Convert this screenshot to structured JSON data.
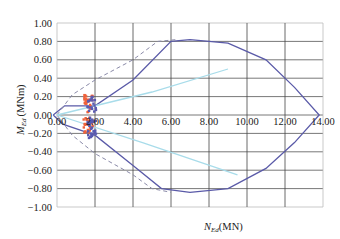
{
  "chart_data": {
    "type": "line",
    "title": "",
    "xlabel": "N_Ed (MN)",
    "ylabel": "M_Ed (MNm)",
    "xlabel_main": "N",
    "xlabel_sub": "Ed",
    "xlabel_unit": "(MN)",
    "ylabel_main": "M",
    "ylabel_sub": "Ed",
    "ylabel_unit": "(MNm)",
    "xlim": [
      0,
      14
    ],
    "ylim": [
      -1.0,
      1.0
    ],
    "grid": true,
    "x_ticks": [
      "0.00",
      "2.00",
      "4.00",
      "6.00",
      "8.00",
      "10.00",
      "12.00",
      "14.00"
    ],
    "y_ticks": [
      "1.00",
      "0.80",
      "0.60",
      "0.40",
      "0.20",
      "0.00",
      "-0.20",
      "-0.40",
      "-0.60",
      "-0.80",
      "-1.00"
    ],
    "series": [
      {
        "name": "interaction-envelope",
        "style": "solid",
        "color": "#5a5aa8",
        "points": [
          [
            -0.2,
            0.0
          ],
          [
            0.4,
            0.1
          ],
          [
            2.0,
            0.1
          ],
          [
            4.0,
            0.38
          ],
          [
            6.0,
            0.8
          ],
          [
            7.0,
            0.82
          ],
          [
            9.0,
            0.78
          ],
          [
            11.0,
            0.6
          ],
          [
            12.5,
            0.3
          ],
          [
            13.8,
            0.0
          ],
          [
            12.5,
            -0.3
          ],
          [
            11.0,
            -0.58
          ],
          [
            9.0,
            -0.8
          ],
          [
            7.0,
            -0.84
          ],
          [
            5.5,
            -0.8
          ],
          [
            4.0,
            -0.55
          ],
          [
            2.0,
            -0.22
          ],
          [
            0.3,
            -0.1
          ],
          [
            -0.2,
            0.0
          ]
        ]
      },
      {
        "name": "envelope-dashed",
        "style": "dashed",
        "color": "#8a8aa8",
        "points": [
          [
            0.0,
            0.0
          ],
          [
            0.8,
            0.22
          ],
          [
            2.0,
            0.38
          ],
          [
            4.0,
            0.6
          ],
          [
            5.3,
            0.8
          ],
          [
            6.3,
            0.82
          ]
        ]
      },
      {
        "name": "envelope-dashed-lower",
        "style": "dashed",
        "color": "#8a8aa8",
        "points": [
          [
            0.0,
            0.0
          ],
          [
            0.8,
            -0.22
          ],
          [
            2.0,
            -0.42
          ],
          [
            4.0,
            -0.65
          ],
          [
            5.0,
            -0.8
          ],
          [
            6.0,
            -0.84
          ]
        ]
      },
      {
        "name": "cyan-line-upper",
        "style": "solid",
        "color": "#a8dcea",
        "points": [
          [
            0.0,
            0.0
          ],
          [
            5.0,
            0.25
          ],
          [
            9.0,
            0.5
          ]
        ]
      },
      {
        "name": "cyan-line-lower",
        "style": "solid",
        "color": "#a8dcea",
        "points": [
          [
            0.0,
            0.0
          ],
          [
            4.5,
            -0.3
          ],
          [
            9.5,
            -0.65
          ]
        ]
      }
    ],
    "scatter": [
      {
        "name": "orange-points",
        "color": "#f0623a",
        "x_range": [
          1.4,
          1.9
        ],
        "y_range": [
          -0.2,
          0.22
        ]
      },
      {
        "name": "blue-points",
        "color": "#5a5ab0",
        "x_range": [
          1.6,
          2.1
        ],
        "y_range": [
          -0.25,
          0.2
        ]
      }
    ]
  }
}
